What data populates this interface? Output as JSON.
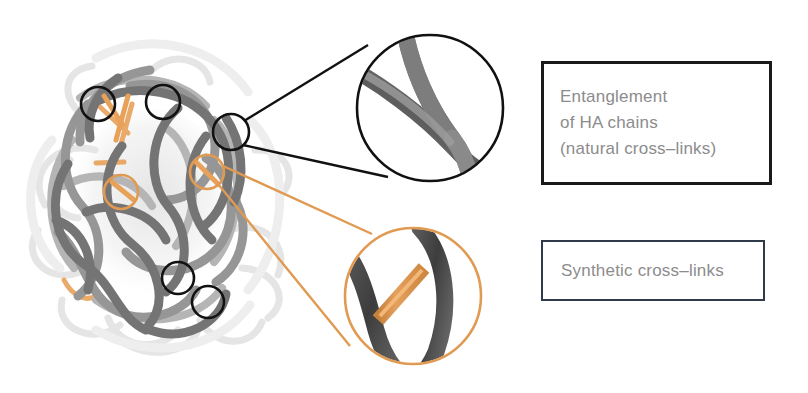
{
  "figure": {
    "background_color": "#ffffff"
  },
  "legend": {
    "items": [
      {
        "id": "entanglement",
        "label": "Entanglement\nof HA chains\n(natural cross–links)",
        "border_color": "#1a1a1a",
        "text_color": "#8c8c8c",
        "marker_shape": "circle",
        "marker_color": "#1a1a1a"
      },
      {
        "id": "synthetic",
        "label": "Synthetic cross–links",
        "border_color": "#2f3b4a",
        "text_color": "#8c8c8c",
        "marker_shape": "circle",
        "marker_color": "#e8a159"
      }
    ]
  },
  "colors": {
    "chain_dark": "#6f6f6f",
    "chain_mid": "#8a8a8a",
    "chain_light": "#b8b8b8",
    "chain_ghost": "#e2e2e2",
    "crosslink_orange": "#e8a159",
    "callout_black": "#111111",
    "callout_orange": "#e09a52",
    "zoom_chain_dark": "#4a4a4a",
    "zoom_chain_gray": "#8e8e8e"
  },
  "annotations": {
    "entanglement_markers": [
      {
        "cx": 98,
        "cy": 104,
        "r": 17
      },
      {
        "cx": 163,
        "cy": 102,
        "r": 17
      },
      {
        "cx": 178,
        "cy": 278,
        "r": 16
      },
      {
        "cx": 208,
        "cy": 302,
        "r": 16
      },
      {
        "cx": 231,
        "cy": 132,
        "r": 18
      }
    ],
    "crosslink_markers": [
      {
        "cx": 121,
        "cy": 192,
        "r": 17
      },
      {
        "cx": 207,
        "cy": 172,
        "r": 17
      }
    ],
    "magnifier_entanglement": {
      "cx": 430,
      "cy": 108,
      "r": 74
    },
    "magnifier_crosslink": {
      "cx": 413,
      "cy": 296,
      "r": 69
    }
  }
}
